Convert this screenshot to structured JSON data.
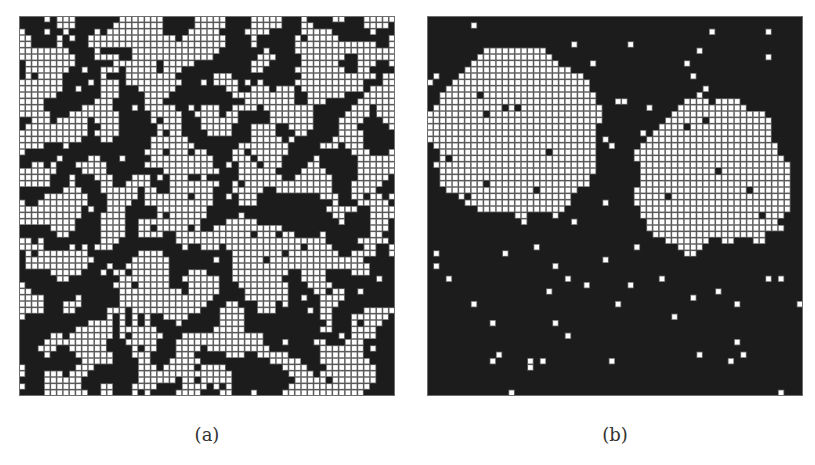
{
  "figure": {
    "panels": [
      {
        "label": "(a)",
        "rows": 60,
        "cols": 60,
        "description": "fine-grained random binary lattice, approx. half white cells",
        "seed": 7,
        "white_fraction": 0.5,
        "smoothing_passes": 2
      },
      {
        "label": "(b)",
        "rows": 60,
        "cols": 60,
        "description": "coarsened binary lattice with large white domains in upper region and mostly black lower region",
        "seed": 11,
        "white_fraction": 0.42,
        "smoothing_passes": 9
      }
    ],
    "colors": {
      "black_cell": "#1c1c1c",
      "white_cell": "#ffffff",
      "grid_line": "#6e6e6e",
      "label_text": "#333333"
    }
  }
}
